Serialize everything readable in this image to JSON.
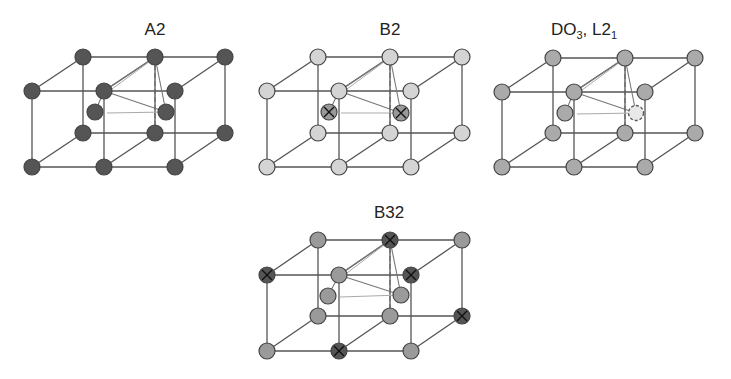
{
  "figure": {
    "panels": [
      {
        "id": "a2",
        "title": "A2",
        "title_sub": "",
        "title_pos": [
          155,
          35
        ],
        "atom_fill": "#555555",
        "atoms": {
          "back_top": [
            [
              83,
              57
            ],
            [
              155,
              57
            ],
            [
              225,
              57
            ]
          ],
          "front_top": [
            [
              32,
              91
            ],
            [
              104,
              91
            ],
            [
              175,
              91
            ]
          ],
          "inner": [
            [
              95,
              112
            ],
            [
              166,
              112
            ]
          ],
          "back_bottom": [
            [
              83,
              133
            ],
            [
              155,
              133
            ],
            [
              225,
              133
            ]
          ],
          "front_bottom": [
            [
              32,
              167
            ],
            [
              104,
              167
            ],
            [
              175,
              167
            ]
          ]
        },
        "inner_fill": "#555555",
        "inner_crossed": false,
        "crossed_atoms": []
      },
      {
        "id": "b2",
        "title": "B2",
        "title_sub": "",
        "title_pos": [
          390,
          35
        ],
        "atom_fill": "#d4d4d4",
        "atoms": {
          "back_top": [
            [
              318,
              57
            ],
            [
              390,
              57
            ],
            [
              462,
              57
            ]
          ],
          "front_top": [
            [
              267,
              91
            ],
            [
              339,
              91
            ],
            [
              411,
              91
            ]
          ],
          "inner": [
            [
              329,
              112
            ],
            [
              401,
              113
            ]
          ],
          "back_bottom": [
            [
              318,
              133
            ],
            [
              390,
              133
            ],
            [
              462,
              133
            ]
          ],
          "front_bottom": [
            [
              267,
              167
            ],
            [
              339,
              167
            ],
            [
              411,
              167
            ]
          ]
        },
        "inner_fill": "#999999",
        "inner_crossed": true,
        "crossed_atoms": []
      },
      {
        "id": "do3-l21",
        "title": "DO",
        "title_sub": "3",
        "title_rest": ", L2",
        "title_sub2": "1",
        "title_pos": [
          584,
          35
        ],
        "atom_fill": "#aaaaaa",
        "atoms": {
          "back_top": [
            [
              553,
              58
            ],
            [
              625,
              58
            ],
            [
              695,
              58
            ]
          ],
          "front_top": [
            [
              502,
              92
            ],
            [
              574,
              92
            ],
            [
              645,
              92
            ]
          ],
          "inner": [
            [
              565,
              113
            ],
            [
              636,
              113
            ]
          ],
          "back_bottom": [
            [
              553,
              133
            ],
            [
              625,
              133
            ],
            [
              695,
              133
            ]
          ],
          "front_bottom": [
            [
              502,
              167
            ],
            [
              574,
              167
            ],
            [
              645,
              167
            ]
          ]
        },
        "inner_fill": "#aaaaaa",
        "inner_crossed": false,
        "inner_vacancy_index": 1,
        "crossed_atoms": []
      },
      {
        "id": "b32",
        "title": "B32",
        "title_sub": "",
        "title_pos": [
          389,
          218
        ],
        "atom_fill": "#9a9a9a",
        "atoms": {
          "back_top": [
            [
              318,
              240
            ],
            [
              390,
              240
            ],
            [
              462,
              240
            ]
          ],
          "front_top": [
            [
              267,
              275
            ],
            [
              339,
              275
            ],
            [
              411,
              275
            ]
          ],
          "inner": [
            [
              328,
              296
            ],
            [
              401,
              295
            ]
          ],
          "back_bottom": [
            [
              318,
              316
            ],
            [
              390,
              316
            ],
            [
              462,
              316
            ]
          ],
          "front_bottom": [
            [
              267,
              351
            ],
            [
              339,
              351
            ],
            [
              411,
              351
            ]
          ]
        },
        "inner_fill": "#9a9a9a",
        "inner_crossed": false,
        "crossed_fill": "#555555",
        "crossed_atoms": [
          [
            390,
            240
          ],
          [
            267,
            275
          ],
          [
            411,
            275
          ],
          [
            462,
            316
          ],
          [
            339,
            351
          ]
        ]
      }
    ],
    "atom_radius": 8,
    "colors": {
      "edge": "#555555",
      "crossed_atom": "#555555",
      "background": "#ffffff"
    }
  }
}
